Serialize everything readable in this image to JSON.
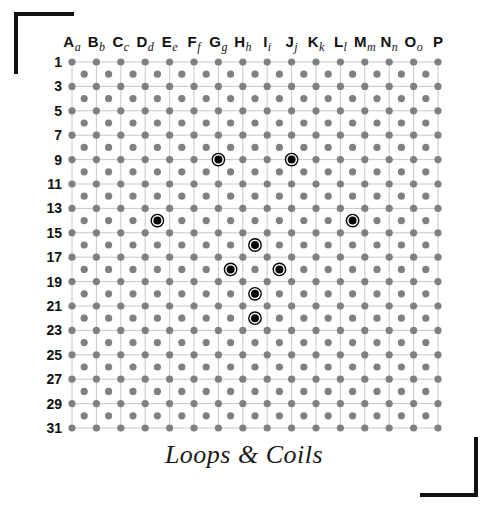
{
  "title": "Loops & Coils",
  "frame": {
    "corner_color": "#111111",
    "corners": [
      "top-left",
      "bottom-right"
    ]
  },
  "grid": {
    "dot_color": "#808080",
    "line_color": "#c8c8c8",
    "marker_fill": "#000000",
    "marker_ring": "#000000",
    "origin_x": 72,
    "origin_y": 62,
    "step": 24.4,
    "columns": [
      {
        "letter": "A",
        "sub": "a"
      },
      {
        "letter": "B",
        "sub": "b"
      },
      {
        "letter": "C",
        "sub": "c"
      },
      {
        "letter": "D",
        "sub": "d"
      },
      {
        "letter": "E",
        "sub": "e"
      },
      {
        "letter": "F",
        "sub": "f"
      },
      {
        "letter": "G",
        "sub": "g"
      },
      {
        "letter": "H",
        "sub": "h"
      },
      {
        "letter": "I",
        "sub": "i"
      },
      {
        "letter": "J",
        "sub": "j"
      },
      {
        "letter": "K",
        "sub": "k"
      },
      {
        "letter": "L",
        "sub": "l"
      },
      {
        "letter": "M",
        "sub": "m"
      },
      {
        "letter": "N",
        "sub": "n"
      },
      {
        "letter": "O",
        "sub": "o"
      },
      {
        "letter": "P",
        "sub": ""
      }
    ],
    "row_labels": [
      "1",
      "3",
      "5",
      "7",
      "9",
      "11",
      "13",
      "15",
      "17",
      "19",
      "21",
      "23",
      "25",
      "27",
      "29",
      "31"
    ],
    "row_count": 31,
    "markers": [
      {
        "col": "G",
        "row": 9,
        "col_index": 6,
        "row_index": 8,
        "label": "G9"
      },
      {
        "col": "J",
        "row": 9,
        "col_index": 9,
        "row_index": 8,
        "label": "J9"
      },
      {
        "col": "d",
        "row": 14,
        "col_index": 3.5,
        "row_index": 13,
        "label": "d14"
      },
      {
        "col": "l",
        "row": 14,
        "col_index": 11.5,
        "row_index": 13,
        "label": "l14"
      },
      {
        "col": "h",
        "row": 16,
        "col_index": 7.5,
        "row_index": 15,
        "label": "h16"
      },
      {
        "col": "g",
        "row": 18,
        "col_index": 6.5,
        "row_index": 17,
        "label": "g18"
      },
      {
        "col": "i",
        "row": 18,
        "col_index": 8.5,
        "row_index": 17,
        "label": "i18"
      },
      {
        "col": "h",
        "row": 20,
        "col_index": 7.5,
        "row_index": 19,
        "label": "h20"
      },
      {
        "col": "h",
        "row": 22,
        "col_index": 7.5,
        "row_index": 21,
        "label": "h22"
      }
    ]
  }
}
